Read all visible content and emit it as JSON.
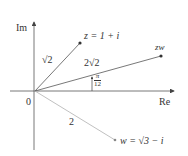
{
  "axes": {
    "x_label": "Re",
    "y_label": "Im",
    "origin_label": "0"
  },
  "points": {
    "z": {
      "label": "z = 1 + i",
      "modulus_label": "√2"
    },
    "zw": {
      "label": "zw",
      "modulus_label": "2√2"
    },
    "w": {
      "label": "w = √3 − i",
      "modulus_label": "2"
    }
  },
  "angle": {
    "numerator": "π",
    "denominator": "12"
  },
  "colors": {
    "axis": "#444444",
    "vector_z": "#555555",
    "vector_zw": "#555555",
    "vector_w": "#aaaaaa",
    "text": "#333333"
  }
}
